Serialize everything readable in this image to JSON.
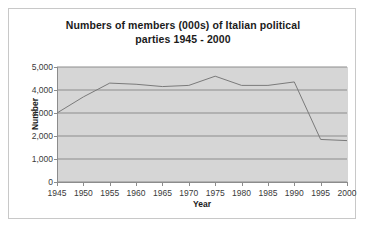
{
  "chart_data": {
    "type": "line",
    "title": "Numbers of members  (000s) of Italian political\nparties 1945 - 2000",
    "xlabel": "Year",
    "ylabel": "Number",
    "x": [
      1945,
      1950,
      1955,
      1960,
      1965,
      1970,
      1975,
      1980,
      1985,
      1990,
      1995,
      2000
    ],
    "values": [
      3000,
      3700,
      4300,
      4250,
      4150,
      4200,
      4600,
      4200,
      4200,
      4350,
      1850,
      1800
    ],
    "series": [
      {
        "name": "Members of Italian political parties",
        "values": [
          3000,
          3700,
          4300,
          4250,
          4150,
          4200,
          4600,
          4200,
          4200,
          4350,
          1850,
          1800
        ]
      }
    ],
    "x_tick_labels": [
      "1945",
      "1950",
      "1955",
      "1960",
      "1965",
      "1970",
      "1975",
      "1980",
      "1985",
      "1990",
      "1995",
      "2000"
    ],
    "y_tick_labels": [
      "0",
      "1,000",
      "2,000",
      "3,000",
      "4,000",
      "5,000"
    ],
    "y_tick_values": [
      0,
      1000,
      2000,
      3000,
      4000,
      5000
    ],
    "xlim": [
      1945,
      2000
    ],
    "ylim": [
      0,
      5000
    ],
    "grid": true,
    "grid_axis": "y",
    "legend": false,
    "plot_background_color": "#d6d6d6",
    "line_color": "#7a7a7a",
    "gridline_color": "#8c8c8c",
    "axis_color": "#8c8c8c"
  }
}
